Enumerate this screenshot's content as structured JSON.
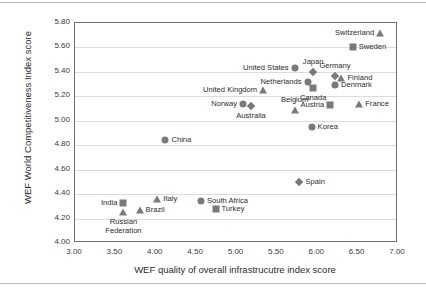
{
  "chart_data": {
    "type": "scatter",
    "title": "",
    "xlabel": "WEF quality of overall infrastrucutre index score",
    "ylabel": "WEF World Competitiveness Index score",
    "xlim": [
      3.0,
      7.0
    ],
    "ylim": [
      4.0,
      5.8
    ],
    "xticks": [
      "3.00",
      "3.50",
      "4.00",
      "4.50",
      "5.00",
      "5.50",
      "6.00",
      "6.50",
      "7.00"
    ],
    "yticks": [
      "4.00",
      "4.20",
      "4.40",
      "4.60",
      "4.80",
      "5.00",
      "5.20",
      "5.40",
      "5.60",
      "5.80"
    ],
    "grid": "horizontal",
    "legend": "none",
    "marker_color": "#7a7a7a",
    "points": [
      {
        "label": "Switzerland",
        "x": 6.78,
        "y": 5.72,
        "marker": "triangle",
        "label_pos": "left"
      },
      {
        "label": "Sweden",
        "x": 6.44,
        "y": 5.6,
        "marker": "square",
        "label_pos": "right"
      },
      {
        "label": "United States",
        "x": 5.72,
        "y": 5.43,
        "marker": "circle",
        "label_pos": "left"
      },
      {
        "label": "Japan",
        "x": 5.95,
        "y": 5.4,
        "marker": "diamond",
        "label_pos": "above"
      },
      {
        "label": "Germany",
        "x": 6.22,
        "y": 5.37,
        "marker": "diamond",
        "label_pos": "above"
      },
      {
        "label": "Finland",
        "x": 6.3,
        "y": 5.35,
        "marker": "triangle",
        "label_pos": "right"
      },
      {
        "label": "Netherlands",
        "x": 5.88,
        "y": 5.32,
        "marker": "circle",
        "label_pos": "left"
      },
      {
        "label": "Denmark",
        "x": 6.22,
        "y": 5.29,
        "marker": "circle",
        "label_pos": "right"
      },
      {
        "label": "Canada",
        "x": 5.95,
        "y": 5.27,
        "marker": "square",
        "label_pos": "below"
      },
      {
        "label": "United Kingdom",
        "x": 5.33,
        "y": 5.25,
        "marker": "triangle",
        "label_pos": "left"
      },
      {
        "label": "Norway",
        "x": 5.08,
        "y": 5.14,
        "marker": "circle",
        "label_pos": "left"
      },
      {
        "label": "Australia",
        "x": 5.18,
        "y": 5.12,
        "marker": "diamond",
        "label_pos": "below"
      },
      {
        "label": "Belgium",
        "x": 5.72,
        "y": 5.09,
        "marker": "triangle",
        "label_pos": "above"
      },
      {
        "label": "Austria",
        "x": 6.16,
        "y": 5.13,
        "marker": "square",
        "label_pos": "left"
      },
      {
        "label": "France",
        "x": 6.52,
        "y": 5.14,
        "marker": "triangle",
        "label_pos": "right"
      },
      {
        "label": "Korea",
        "x": 5.93,
        "y": 4.95,
        "marker": "circle",
        "label_pos": "right"
      },
      {
        "label": "China",
        "x": 4.12,
        "y": 4.84,
        "marker": "circle",
        "label_pos": "right"
      },
      {
        "label": "Spain",
        "x": 5.78,
        "y": 4.5,
        "marker": "diamond",
        "label_pos": "right"
      },
      {
        "label": "Italy",
        "x": 4.02,
        "y": 4.36,
        "marker": "triangle",
        "label_pos": "right"
      },
      {
        "label": "South Africa",
        "x": 4.56,
        "y": 4.34,
        "marker": "circle",
        "label_pos": "right"
      },
      {
        "label": "India",
        "x": 3.6,
        "y": 4.33,
        "marker": "square",
        "label_pos": "left"
      },
      {
        "label": "Turkey",
        "x": 4.74,
        "y": 4.28,
        "marker": "square",
        "label_pos": "right"
      },
      {
        "label": "Brazil",
        "x": 3.8,
        "y": 4.27,
        "marker": "triangle",
        "label_pos": "right"
      },
      {
        "label": "Russian Federation",
        "x": 3.6,
        "y": 4.25,
        "marker": "triangle",
        "label_pos": "below"
      }
    ]
  }
}
